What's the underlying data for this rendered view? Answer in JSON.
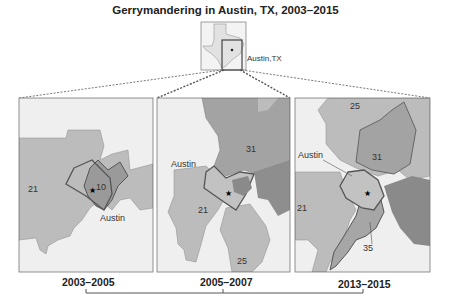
{
  "title": "Gerrymandering in Austin, TX, 2003–2015",
  "inset": {
    "label": "Austin,TX"
  },
  "panels": [
    {
      "period": "2003–2005",
      "districts": [
        "21",
        "10"
      ],
      "city_label": "Austin"
    },
    {
      "period": "2005–2007",
      "districts": [
        "31",
        "21",
        "25"
      ],
      "city_label": "Austin"
    },
    {
      "period": "2013–2015",
      "districts": [
        "25",
        "31",
        "21",
        "35"
      ],
      "city_label": "Austin"
    }
  ],
  "colors": {
    "background": "#efefef",
    "light_district": "#c8c8c8",
    "mid_district": "#a9a9a9",
    "dark_district": "#8a8a8a",
    "boundary": "#555555"
  }
}
